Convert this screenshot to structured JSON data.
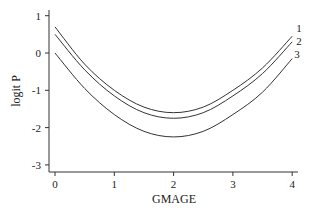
{
  "chart_data": {
    "type": "line",
    "title": "",
    "xlabel": "GMAGE",
    "ylabel": "logit P",
    "xlim": [
      0,
      4
    ],
    "ylim": [
      -3,
      1
    ],
    "xticks": [
      0,
      1,
      2,
      3,
      4
    ],
    "yticks": [
      1,
      0,
      -1,
      -2,
      -3
    ],
    "grid": false,
    "legend": "curve labels at right end",
    "x": [
      0,
      0.5,
      1,
      1.5,
      2,
      2.5,
      3,
      3.5,
      4
    ],
    "series": [
      {
        "name": "1",
        "values": [
          0.7,
          -0.3,
          -1.0,
          -1.45,
          -1.6,
          -1.45,
          -1.0,
          -0.4,
          0.45
        ]
      },
      {
        "name": "2",
        "values": [
          0.5,
          -0.45,
          -1.15,
          -1.6,
          -1.75,
          -1.6,
          -1.15,
          -0.55,
          0.3
        ]
      },
      {
        "name": "3",
        "values": [
          0.0,
          -0.95,
          -1.65,
          -2.1,
          -2.25,
          -2.1,
          -1.65,
          -1.05,
          -0.15
        ]
      }
    ]
  }
}
